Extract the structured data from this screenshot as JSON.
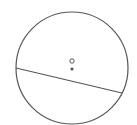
{
  "diagram": {
    "type": "circle-with-chord",
    "stroke_color": "#555555",
    "background": "#ffffff",
    "circle": {
      "cx": 72,
      "cy": 68,
      "r": 56
    },
    "chord": {
      "x1": 16,
      "y1": 68,
      "x2": 122,
      "y2": 93
    },
    "center_point": {
      "cx": 72,
      "cy": 61,
      "r": 2.2,
      "style": "open"
    },
    "dot_point": {
      "cx": 72,
      "cy": 69,
      "r": 1.6,
      "style": "filled"
    }
  }
}
